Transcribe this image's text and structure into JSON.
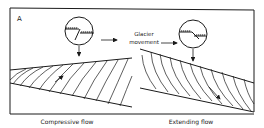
{
  "figure": {
    "panel_label": "A",
    "center_label_line1": "Glacier",
    "center_label_line2": "movement",
    "left_caption": "Compressive flow",
    "right_caption": "Extending flow"
  },
  "colors": {
    "ink": "#1a1a1a",
    "background": "#ffffff"
  }
}
